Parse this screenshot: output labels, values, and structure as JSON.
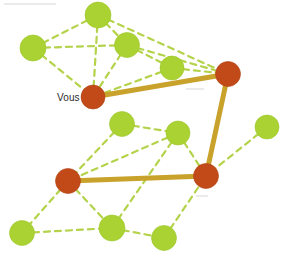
{
  "canvas": {
    "width": 295,
    "height": 259,
    "background": "#ffffff"
  },
  "graph": {
    "title": "Reseau de contacts",
    "type": "node-link-network",
    "colors": {
      "node_green": "#a9d232",
      "node_green_edge": "#9ec62b",
      "node_red": "#c14a18",
      "node_red_edge": "#b24315",
      "edge_dashed": "#b4d34a",
      "edge_solid": "#c8a22a",
      "label_text": "#2b2b2b"
    },
    "style": {
      "dashed_width": 2.2,
      "dashed_dasharray": "6,5",
      "solid_width": 5.0,
      "node_radius_green": 12.5,
      "node_radius_red": 12.0
    },
    "nodes": [
      {
        "id": "g1",
        "x": 98,
        "y": 15,
        "r": 13,
        "kind": "green",
        "label": ""
      },
      {
        "id": "g2",
        "x": 33,
        "y": 48,
        "r": 13,
        "kind": "green",
        "label": ""
      },
      {
        "id": "g3",
        "x": 127,
        "y": 45,
        "r": 12.5,
        "kind": "green",
        "label": ""
      },
      {
        "id": "g4",
        "x": 172,
        "y": 68,
        "r": 12,
        "kind": "green",
        "label": ""
      },
      {
        "id": "r1",
        "x": 93,
        "y": 97,
        "r": 12,
        "kind": "red",
        "label": "Vous"
      },
      {
        "id": "r2",
        "x": 228,
        "y": 74,
        "r": 12.5,
        "kind": "red",
        "label": ""
      },
      {
        "id": "g5",
        "x": 122,
        "y": 124,
        "r": 12.5,
        "kind": "green",
        "label": ""
      },
      {
        "id": "g6",
        "x": 178,
        "y": 133,
        "r": 12,
        "kind": "green",
        "label": ""
      },
      {
        "id": "g7",
        "x": 267,
        "y": 127,
        "r": 12,
        "kind": "green",
        "label": ""
      },
      {
        "id": "r3",
        "x": 68,
        "y": 181,
        "r": 12.5,
        "kind": "red",
        "label": ""
      },
      {
        "id": "r4",
        "x": 206,
        "y": 176,
        "r": 12.5,
        "kind": "red",
        "label": ""
      },
      {
        "id": "g8",
        "x": 22,
        "y": 233,
        "r": 12.5,
        "kind": "green",
        "label": ""
      },
      {
        "id": "g9",
        "x": 112,
        "y": 228,
        "r": 13,
        "kind": "green",
        "label": ""
      },
      {
        "id": "g10",
        "x": 164,
        "y": 238,
        "r": 12.5,
        "kind": "green",
        "label": ""
      }
    ],
    "edges_dashed": [
      {
        "from": "g2",
        "to": "g1"
      },
      {
        "from": "g2",
        "to": "g3"
      },
      {
        "from": "g2",
        "to": "r1"
      },
      {
        "from": "g1",
        "to": "g3"
      },
      {
        "from": "g1",
        "to": "r1"
      },
      {
        "from": "g1",
        "to": "r2"
      },
      {
        "from": "g3",
        "to": "g4"
      },
      {
        "from": "g3",
        "to": "r1"
      },
      {
        "from": "g3",
        "to": "r2"
      },
      {
        "from": "g4",
        "to": "r1"
      },
      {
        "from": "g4",
        "to": "r2"
      },
      {
        "from": "r1",
        "to": "r2"
      },
      {
        "from": "g5",
        "to": "g6"
      },
      {
        "from": "g5",
        "to": "r3"
      },
      {
        "from": "g6",
        "to": "r3"
      },
      {
        "from": "g6",
        "to": "g9"
      },
      {
        "from": "g6",
        "to": "r4"
      },
      {
        "from": "g7",
        "to": "r4"
      },
      {
        "from": "r3",
        "to": "g8"
      },
      {
        "from": "r3",
        "to": "g9"
      },
      {
        "from": "g8",
        "to": "g9"
      },
      {
        "from": "g9",
        "to": "g10"
      },
      {
        "from": "g10",
        "to": "r4"
      }
    ],
    "edges_solid": [
      {
        "from": "r1",
        "to": "r2"
      },
      {
        "from": "r2",
        "to": "r4"
      },
      {
        "from": "r4",
        "to": "r3"
      }
    ],
    "labels": [
      {
        "text": "Vous",
        "x": 57,
        "y": 92,
        "node": "r1"
      }
    ],
    "artifacts": [
      {
        "name": "scan-smudge-top-left",
        "x": 4,
        "y": 3,
        "w": 52,
        "h": 2
      },
      {
        "name": "scan-smudge-mid-right",
        "x": 186,
        "y": 88,
        "w": 18,
        "h": 2
      },
      {
        "name": "scan-smudge-lower",
        "x": 196,
        "y": 195,
        "w": 12,
        "h": 2
      }
    ]
  }
}
